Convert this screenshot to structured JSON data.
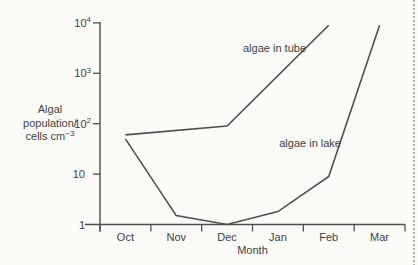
{
  "page": {
    "background": "#fbfbf7",
    "edge_dash_color": "#b2b2ac"
  },
  "chart_data": {
    "type": "line",
    "title": "",
    "xlabel": "Month",
    "ylabel": "Algal population/ cells cm−3",
    "x_categories": [
      "Oct",
      "Nov",
      "Dec",
      "Jan",
      "Feb",
      "Mar"
    ],
    "y_scale": "log",
    "ylim": [
      1,
      10000
    ],
    "grid": false,
    "legend": "inline-labels",
    "line_color": "#4f4f4f",
    "text_color": "#3f3f3f",
    "y_axis_label_lines": [
      [
        {
          "text": "Algal"
        }
      ],
      [
        {
          "text": "population/"
        }
      ],
      [
        {
          "text": "cells cm"
        },
        {
          "text": "−3",
          "sup": true
        }
      ]
    ],
    "y_ticks": [
      {
        "value": 10000,
        "label": [
          {
            "text": "10"
          },
          {
            "text": "4",
            "sup": true
          }
        ]
      },
      {
        "value": 1000,
        "label": [
          {
            "text": "10"
          },
          {
            "text": "3",
            "sup": true
          }
        ]
      },
      {
        "value": 100,
        "label": [
          {
            "text": "10"
          },
          {
            "text": "2",
            "sup": true
          }
        ]
      },
      {
        "value": 10,
        "label": [
          {
            "text": "10"
          }
        ]
      },
      {
        "value": 1,
        "label": [
          {
            "text": "1"
          }
        ]
      }
    ],
    "series": [
      {
        "name": "algae in tube",
        "points": [
          {
            "month": "Oct",
            "value": 60
          },
          {
            "month": "Dec",
            "value": 90
          },
          {
            "month": "Feb",
            "value": 9000
          }
        ],
        "label": {
          "text": "algae in tube",
          "x": 306,
          "y": 52,
          "anchor": "end"
        }
      },
      {
        "name": "algae in lake",
        "points": [
          {
            "month": "Oct",
            "value": 50
          },
          {
            "month": "Nov",
            "value": 1.5
          },
          {
            "month": "Dec",
            "value": 1
          },
          {
            "month": "Jan",
            "value": 1.8
          },
          {
            "month": "Feb",
            "value": 9
          },
          {
            "month": "Mar",
            "value": 9000
          }
        ],
        "label": {
          "text": "algae in lake",
          "x": 341,
          "y": 147,
          "anchor": "end"
        }
      }
    ]
  }
}
